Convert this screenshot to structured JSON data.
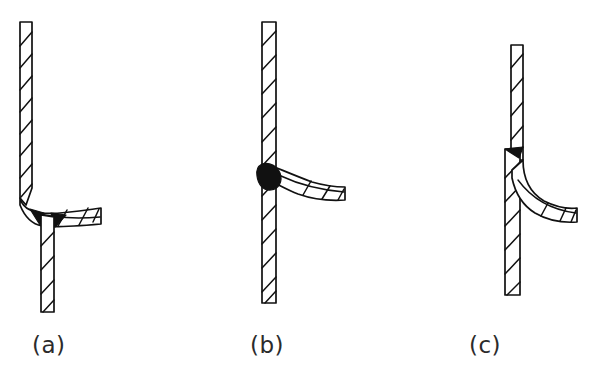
{
  "figure": {
    "background_color": "#ffffff",
    "line_color": "#111111",
    "weld_fill_color": "#111111",
    "panels": [
      {
        "id": "a",
        "caption": "(a)",
        "description": "Vertical hatched bar with a curved flange bending to the right at a junction; a small solid black weld wedge sits under the bend and the bar continues downward below the joint.",
        "vertical_bar": {
          "top_y": 22,
          "bottom_y": 312,
          "upper_left_x": 20,
          "upper_right_x": 32,
          "lower_left_x": 41,
          "lower_right_x": 54,
          "hatch_stripe_count_upper": 9,
          "hatch_stripe_count_lower": 6
        },
        "flange": {
          "tip_x": 101,
          "tip_top_y": 208,
          "tip_bottom_y": 224,
          "curve_start_y": 185
        },
        "weld_blobs": [
          {
            "name": "weld-wedge-left",
            "cx": 36,
            "cy": 216
          },
          {
            "name": "weld-wedge-right",
            "cx": 57,
            "cy": 216
          }
        ]
      },
      {
        "id": "b",
        "caption": "(b)",
        "description": "Straight continuous vertical hatched bar with a curved flange welded on its right side; a large solid black weld bead fills the inside corner of the joint.",
        "vertical_bar": {
          "top_y": 22,
          "bottom_y": 303,
          "left_x": 262,
          "right_x": 276,
          "hatch_stripe_count": 17
        },
        "flange": {
          "tip_x": 345,
          "tip_top_y": 187,
          "tip_bottom_y": 200,
          "root_y": 168
        },
        "weld_blobs": [
          {
            "name": "weld-bead",
            "cx": 268,
            "cy": 176,
            "rx": 11,
            "ry": 13
          }
        ]
      },
      {
        "id": "c",
        "caption": "(c)",
        "description": "Vertical hatched bar offset at the joint: the upper segment is shifted right, the lower segment is wider and shifted left; a small solid black weld triangle marks the step, and a curved flange sweeps down and to the right.",
        "vertical_bar": {
          "top_y": 45,
          "bottom_y": 295,
          "upper_left_x": 511,
          "upper_right_x": 523,
          "lower_left_x": 505,
          "lower_right_x": 520,
          "step_y": 148,
          "hatch_stripe_count_upper": 6,
          "hatch_stripe_count_lower": 9
        },
        "flange": {
          "tip_x": 577,
          "tip_top_y": 208,
          "tip_bottom_y": 222,
          "root_y": 160
        },
        "weld_blobs": [
          {
            "name": "weld-triangle",
            "cx": 513,
            "cy": 152
          }
        ]
      }
    ]
  }
}
